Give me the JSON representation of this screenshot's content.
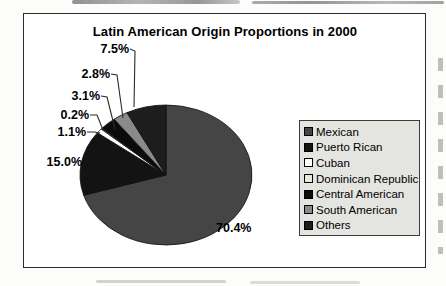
{
  "colors": {
    "canvas_bg": "#fcfcfb",
    "frame_border": "#2b2b2b",
    "legend_bg": "#e4e4e0",
    "legend_border": "#3c3c3c",
    "leader_line": "#2b2b2b",
    "scan_streak": "#8d8d8d",
    "text": "#000000"
  },
  "chart_data": {
    "type": "pie",
    "title": "Latin American Origin Proportions in 2000",
    "unit": "percent",
    "start_angle_deg": 0,
    "direction": "clockwise",
    "grid": false,
    "legend_position": "right",
    "categories": [
      "Mexican",
      "Puerto Rican",
      "Cuban",
      "Dominican Republic",
      "Central American",
      "South American",
      "Others"
    ],
    "values": [
      70.4,
      15.0,
      1.1,
      0.2,
      3.1,
      2.8,
      7.5
    ],
    "series": [
      {
        "name": "Mexican",
        "value": 70.4,
        "label": "70.4%",
        "color": "#454545"
      },
      {
        "name": "Puerto Rican",
        "value": 15.0,
        "label": "15.0%",
        "color": "#131313"
      },
      {
        "name": "Cuban",
        "value": 1.1,
        "label": "1.1%",
        "color": "#ffffff"
      },
      {
        "name": "Dominican Republic",
        "value": 0.2,
        "label": "0.2%",
        "color": "#eae8dc"
      },
      {
        "name": "Central American",
        "value": 3.1,
        "label": "3.1%",
        "color": "#0b0b0b"
      },
      {
        "name": "South American",
        "value": 2.8,
        "label": "2.8%",
        "color": "#8a8a8a"
      },
      {
        "name": "Others",
        "value": 7.5,
        "label": "7.5%",
        "color": "#1d1d1d"
      }
    ]
  },
  "layout": {
    "pie": {
      "cx": 166,
      "cy": 175,
      "rx": 86,
      "ry": 70,
      "stroke": "#0e0e0e",
      "stroke_width": 0.8
    },
    "labels": [
      {
        "x": 216,
        "y": 232,
        "anchor": "start"
      },
      {
        "x": 82,
        "y": 166,
        "anchor": "end"
      },
      {
        "x": 86,
        "y": 136,
        "anchor": "end"
      },
      {
        "x": 89,
        "y": 119,
        "anchor": "end"
      },
      {
        "x": 100,
        "y": 100,
        "anchor": "end"
      },
      {
        "x": 110,
        "y": 78,
        "anchor": "end"
      },
      {
        "x": 129,
        "y": 53,
        "anchor": "end"
      }
    ],
    "leaders": [
      null,
      null,
      [
        [
          87,
          132
        ],
        [
          94,
          132
        ],
        [
          100,
          133
        ]
      ],
      [
        [
          90,
          115
        ],
        [
          97,
          115
        ],
        [
          103,
          130
        ]
      ],
      [
        [
          101,
          96
        ],
        [
          107,
          97
        ],
        [
          115,
          129
        ]
      ],
      [
        [
          111,
          74
        ],
        [
          117,
          75
        ],
        [
          123,
          118
        ]
      ],
      [
        [
          130,
          49
        ],
        [
          135,
          51
        ],
        [
          134,
          107
        ]
      ]
    ]
  }
}
